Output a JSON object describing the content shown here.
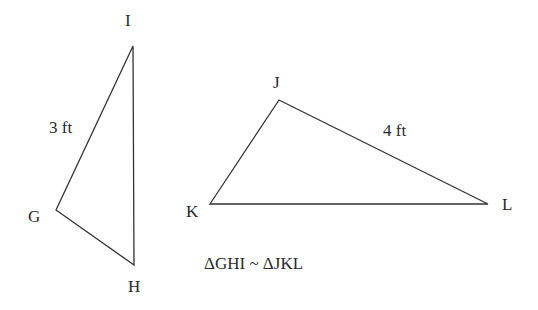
{
  "diagram": {
    "triangle_ghi": {
      "vertices": [
        {
          "name": "G",
          "label": "G",
          "x": 56,
          "y": 210
        },
        {
          "name": "H",
          "label": "H",
          "x": 134,
          "y": 265
        },
        {
          "name": "I",
          "label": "I",
          "x": 133,
          "y": 46
        }
      ],
      "side_label": {
        "side": "GI",
        "text": "3 ft"
      }
    },
    "triangle_jkl": {
      "vertices": [
        {
          "name": "J",
          "label": "J",
          "x": 279,
          "y": 100
        },
        {
          "name": "K",
          "label": "K",
          "x": 210,
          "y": 204
        },
        {
          "name": "L",
          "label": "L",
          "x": 488,
          "y": 204
        }
      ],
      "side_label": {
        "side": "JL",
        "text": "4 ft"
      }
    },
    "statement": "ΔGHI ~ ΔJKL",
    "colors": {
      "stroke": "#333333",
      "text": "#2a2a2a",
      "background": "#ffffff"
    }
  }
}
